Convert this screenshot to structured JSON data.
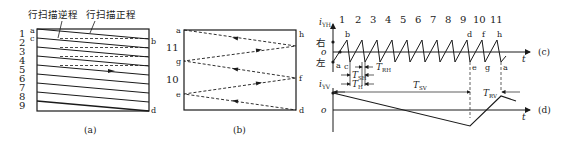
{
  "panel_a": {
    "caption": "(a)",
    "label_retrace": "行扫描逆程",
    "label_trace": "行扫描正程",
    "line_numbers": [
      "1",
      "2",
      "3",
      "4",
      "5",
      "6",
      "7",
      "8",
      "9"
    ],
    "point_labels": {
      "a": "a",
      "c": "c",
      "b": "b",
      "d": "d"
    }
  },
  "panel_b": {
    "caption": "(b)",
    "line_numbers": [
      "11",
      "10"
    ],
    "point_labels": {
      "a": "a",
      "g": "g",
      "e": "e",
      "h": "h",
      "f": "f",
      "d": "d"
    }
  },
  "panel_c": {
    "caption": "(c)",
    "y_label": "i",
    "y_label_sub": "YH",
    "right_label": "右",
    "origin_label": "o",
    "left_label": "左",
    "t_label": "t",
    "line_numbers": [
      "1",
      "2",
      "3",
      "4",
      "5",
      "6",
      "7",
      "8",
      "9",
      "10",
      "11"
    ],
    "point_labels": {
      "a": "a",
      "b": "b",
      "c": "c",
      "d": "d",
      "e": "e",
      "f": "f",
      "g": "g",
      "h": "h",
      "a2": "a"
    },
    "T_RH": "T",
    "T_RH_sub": "RH",
    "T_SH": "T",
    "T_SH_sub": "SH",
    "T_H": "T",
    "T_H_sub": "H"
  },
  "panel_d": {
    "caption": "(d)",
    "y_label": "i",
    "y_label_sub": "YV",
    "origin_label": "o",
    "t_label": "t",
    "T_SV": "T",
    "T_SV_sub": "SV",
    "T_RV": "T",
    "T_RV_sub": "RV"
  },
  "colors": {
    "line": "#1a1a1a",
    "text": "#222222",
    "background": "#ffffff"
  }
}
